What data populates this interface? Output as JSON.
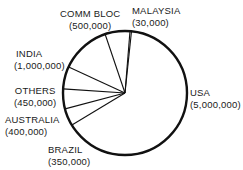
{
  "chart_data": {
    "type": "pie",
    "title": "",
    "categories": [
      "USA",
      "BRAZIL",
      "AUSTRALIA",
      "OTHERS",
      "INDIA",
      "COMM BLOC",
      "MALAYSIA"
    ],
    "values": [
      5000000,
      350000,
      400000,
      450000,
      1000000,
      500000,
      30000
    ],
    "value_labels": [
      "(5,000,000)",
      "(350,000)",
      "(400,000)",
      "(450,000)",
      "(1,000,000)",
      "(500,000)",
      "(30,000)"
    ],
    "direction": "clockwise",
    "start": "top",
    "legend": "none",
    "grid": false,
    "colors": {
      "fill": "#ffffff",
      "stroke": "#111111"
    }
  },
  "labels": {
    "usa": {
      "name": "USA",
      "value": "(5,000,000)"
    },
    "brazil": {
      "name": "BRAZIL",
      "value": "(350,000)"
    },
    "australia": {
      "name": "AUSTRALIA",
      "value": "(400,000)"
    },
    "others": {
      "name": "OTHERS",
      "value": "(450,000)"
    },
    "india": {
      "name": "INDIA",
      "value": "(1,000,000)"
    },
    "comm_bloc": {
      "name": "COMM BLOC",
      "value": "(500,000)"
    },
    "malaysia": {
      "name": "MALAYSIA",
      "value": "(30,000)"
    }
  }
}
